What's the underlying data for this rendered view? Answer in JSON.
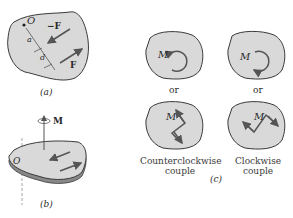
{
  "figure": {
    "panel_a": {
      "caption": "(a)",
      "labels": {
        "origin": "O",
        "a": "a",
        "d": "d",
        "neg_force": "−F",
        "force": "F"
      }
    },
    "panel_b": {
      "caption": "(b)",
      "labels": {
        "origin": "O",
        "moment": "M"
      }
    },
    "panel_c": {
      "caption": "(c)",
      "moment_label": "M",
      "or_label": "or",
      "counterclockwise_caption_line1": "Counterclockwise",
      "counterclockwise_caption_line2": "couple",
      "clockwise_caption_line1": "Clockwise",
      "clockwise_caption_line2": "couple"
    },
    "colors": {
      "body_fill": "#d9d9d9",
      "outline": "#3a3a3a",
      "arrow": "#555555"
    }
  }
}
